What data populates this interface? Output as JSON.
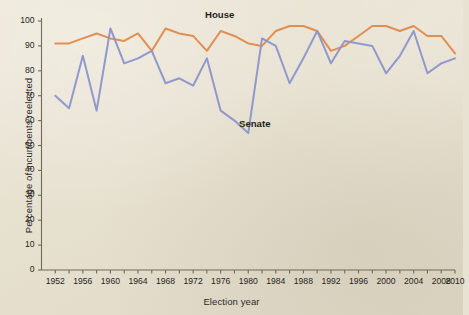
{
  "figure": {
    "background_color": "#e8e2d2",
    "axis_color": "#6f6a5c",
    "text_color": "#25251f"
  },
  "axis_titles": {
    "y": "Percentage of incumbents reelected",
    "x": "Election year"
  },
  "series_labels": {
    "house": "House",
    "senate": "Senate"
  },
  "colors": {
    "house": "#e08a4a",
    "senate": "#8b93cc"
  },
  "chart_data": {
    "type": "line",
    "title": "",
    "xlabel": "Election year",
    "ylabel": "Percentage of incumbents reelected",
    "xlim": [
      1950,
      2010
    ],
    "ylim": [
      0,
      100
    ],
    "grid": false,
    "legend": "inline-annotations",
    "y_ticks": [
      0,
      10,
      20,
      30,
      40,
      50,
      60,
      70,
      80,
      90,
      100
    ],
    "y_tick_labels": [
      "0",
      "10",
      "20",
      "30",
      "40",
      "50",
      "60",
      "70",
      "80",
      "90",
      "100"
    ],
    "x_ticks": [
      1952,
      1954,
      1956,
      1958,
      1960,
      1962,
      1964,
      1966,
      1968,
      1970,
      1972,
      1974,
      1976,
      1978,
      1980,
      1982,
      1984,
      1986,
      1988,
      1990,
      1992,
      1994,
      1996,
      1998,
      2000,
      2002,
      2004,
      2006,
      2008,
      2010
    ],
    "x_tick_labels": [
      "1952",
      "1956",
      "1960",
      "1964",
      "1968",
      "1972",
      "1976",
      "1980",
      "1984",
      "1988",
      "1992",
      "1996",
      "2000",
      "2004",
      "2008",
      "2010"
    ],
    "x_labeled_years": [
      1952,
      1956,
      1960,
      1964,
      1968,
      1972,
      1976,
      1980,
      1984,
      1988,
      1992,
      1996,
      2000,
      2004,
      2008,
      2010
    ],
    "x": [
      1952,
      1954,
      1956,
      1958,
      1960,
      1962,
      1964,
      1966,
      1968,
      1970,
      1972,
      1974,
      1976,
      1978,
      1980,
      1982,
      1984,
      1986,
      1988,
      1990,
      1992,
      1994,
      1996,
      1998,
      2000,
      2002,
      2004,
      2006,
      2008,
      2010
    ],
    "series": [
      {
        "name": "House",
        "color": "#e08a4a",
        "values": [
          91,
          91,
          93,
          95,
          93,
          92,
          95,
          88,
          97,
          95,
          94,
          88,
          96,
          94,
          91,
          90,
          96,
          98,
          98,
          96,
          88,
          90,
          94,
          98,
          98,
          96,
          98,
          94,
          94,
          87
        ]
      },
      {
        "name": "Senate",
        "color": "#8b93cc",
        "values": [
          70,
          65,
          86,
          64,
          97,
          83,
          85,
          88,
          75,
          77,
          74,
          85,
          64,
          60,
          55,
          93,
          90,
          75,
          85,
          96,
          83,
          92,
          91,
          90,
          79,
          86,
          96,
          79,
          83,
          85
        ]
      }
    ]
  }
}
